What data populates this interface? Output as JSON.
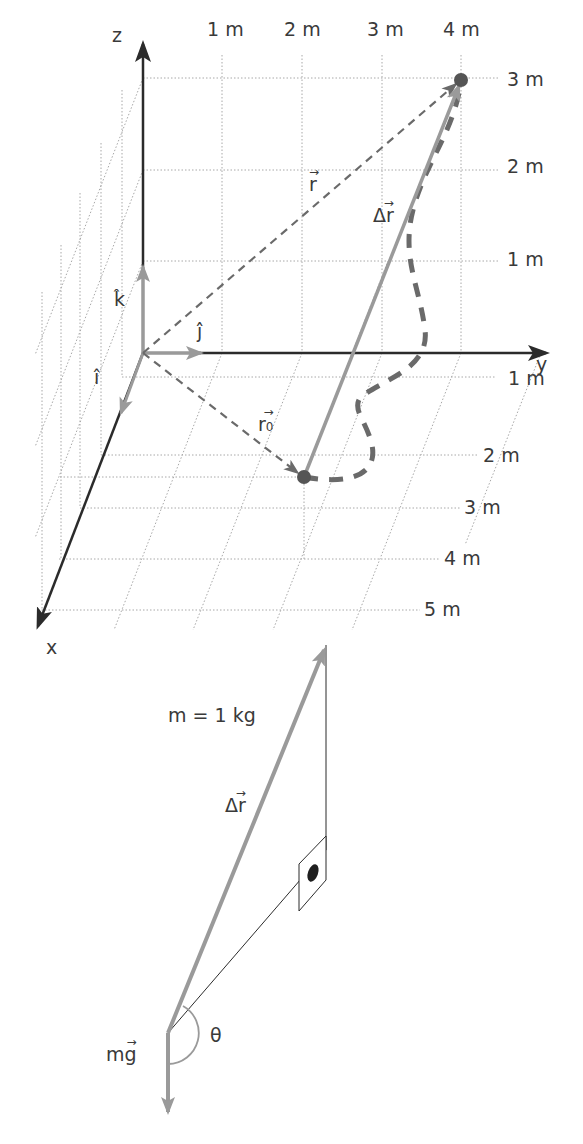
{
  "diagram": {
    "type": "3d-vector-diagram",
    "axes": {
      "x_label": "x",
      "y_label": "y",
      "z_label": "z"
    },
    "unit_vectors": {
      "i": "î",
      "j": "ĵ",
      "k": "k̂"
    },
    "y_ticks": [
      "1 m",
      "2 m",
      "3 m",
      "4 m"
    ],
    "z_ticks": [
      "3 m",
      "2 m",
      "1 m"
    ],
    "x_ticks": [
      "1 m",
      "2 m",
      "3 m",
      "4 m",
      "5 m"
    ],
    "vectors": {
      "r": {
        "symbol": "r",
        "arrow": "→"
      },
      "r0": {
        "symbol": "r",
        "subscript": "0",
        "arrow": "→"
      },
      "delta_r": {
        "symbol": "Δr",
        "arrow": "→"
      }
    },
    "points": {
      "start": {
        "x_m": 2,
        "y_m": 2,
        "z_m": 0
      },
      "end": {
        "x_m": 0,
        "y_m": 4,
        "z_m": 3
      }
    },
    "lower": {
      "mass_label": "m = 1 kg",
      "delta_r_label": "Δr",
      "delta_r_arrow": "→",
      "weight_label": "mg",
      "weight_arrow": "→",
      "angle_label": "θ"
    },
    "colors": {
      "axis": "#2b2b2b",
      "vector_gray": "#9a9a9a",
      "dashed": "#6a6a6a",
      "grid": "#a8a8a8",
      "point": "#555555"
    }
  }
}
